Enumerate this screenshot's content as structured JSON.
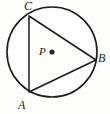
{
  "figure": {
    "type": "geometry-diagram",
    "colors": {
      "stroke": "#1c1c1c",
      "shading": "#9a9a9a",
      "triangle_fill": "#ffffff",
      "background": "#fdfdfc",
      "center_dot": "#2a2a2a"
    },
    "circle": {
      "label": "circle-P",
      "center": {
        "x": 52,
        "y": 52
      },
      "radius": 45
    },
    "center_point": {
      "label": "P",
      "marker": "filled-dot",
      "x": 52,
      "y": 52
    },
    "triangle": {
      "label": "triangle-ABC",
      "vertices": [
        {
          "label": "A",
          "x": 29,
          "y": 92
        },
        {
          "label": "B",
          "x": 96,
          "y": 60
        },
        {
          "label": "C",
          "x": 29,
          "y": 16
        }
      ]
    },
    "labels": {
      "C": "C",
      "B": "B",
      "A": "A",
      "P": "P"
    }
  }
}
